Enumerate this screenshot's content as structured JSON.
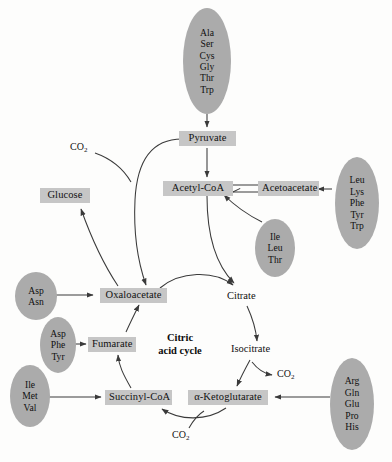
{
  "diagram": {
    "center_caption_line1": "Citric",
    "center_caption_line2": "acid cycle",
    "colors": {
      "box_fill": "#c6c6c6",
      "bubble_fill": "#ababab",
      "edge_stroke": "#3a3a3a",
      "background": "#fdfdfc",
      "text": "#121212"
    }
  },
  "metabolite_boxes": [
    {
      "id": "pyruvate",
      "label": "Pyruvate"
    },
    {
      "id": "acetyl_coa",
      "label": "Acetyl-CoA"
    },
    {
      "id": "acetoacetate",
      "label": "Acetoacetate"
    },
    {
      "id": "glucose",
      "label": "Glucose"
    },
    {
      "id": "oxaloacetate",
      "label": "Oxaloacetate"
    },
    {
      "id": "fumarate",
      "label": "Fumarate"
    },
    {
      "id": "succinyl_coa",
      "label": "Succinyl-CoA"
    },
    {
      "id": "alpha_ketoglutarate",
      "label": "α-Ketoglutarate"
    }
  ],
  "plain_labels": [
    {
      "id": "citrate",
      "label": "Citrate"
    },
    {
      "id": "isocitrate",
      "label": "Isocitrate"
    }
  ],
  "amino_acid_groups": [
    {
      "id": "to_pyruvate",
      "target": "Pyruvate",
      "residues": [
        "Ala",
        "Ser",
        "Cys",
        "Gly",
        "Thr",
        "Trp"
      ]
    },
    {
      "id": "to_acetoacetate",
      "target": "Acetoacetate",
      "residues": [
        "Leu",
        "Lys",
        "Phe",
        "Tyr",
        "Trp"
      ]
    },
    {
      "id": "to_acetyl_coa",
      "target": "Acetyl-CoA",
      "residues": [
        "Ile",
        "Leu",
        "Thr"
      ]
    },
    {
      "id": "to_oxaloacetate",
      "target": "Oxaloacetate",
      "residues": [
        "Asp",
        "Asn"
      ]
    },
    {
      "id": "to_fumarate",
      "target": "Fumarate",
      "residues": [
        "Asp",
        "Phe",
        "Tyr"
      ]
    },
    {
      "id": "to_succinyl_coa",
      "target": "Succinyl-CoA",
      "residues": [
        "Ile",
        "Met",
        "Val"
      ]
    },
    {
      "id": "to_alpha_kg",
      "target": "α-Ketoglutarate",
      "residues": [
        "Arg",
        "Gln",
        "Glu",
        "Pro",
        "His"
      ]
    }
  ],
  "byproduct_labels": [
    {
      "id": "co2_pyruvate_carboxylation",
      "formula": "CO",
      "subscript": "2"
    },
    {
      "id": "co2_isocitrate_dehydrogenase",
      "formula": "CO",
      "subscript": "2"
    },
    {
      "id": "co2_alpha_kg_dehydrogenase",
      "formula": "CO",
      "subscript": "2"
    }
  ],
  "reactions": [
    {
      "id": "aa_to_pyruvate",
      "from": "Ala/Ser/Cys/Gly/Thr/Trp",
      "to": "Pyruvate",
      "type": "single"
    },
    {
      "id": "pyruvate_to_acetyl_coa",
      "from": "Pyruvate",
      "to": "Acetyl-CoA",
      "type": "single"
    },
    {
      "id": "pyruvate_to_oxaloacetate",
      "from": "Pyruvate",
      "to": "Oxaloacetate",
      "type": "single"
    },
    {
      "id": "oxaloacetate_to_glucose",
      "from": "Oxaloacetate",
      "to": "Glucose",
      "type": "single"
    },
    {
      "id": "acetyl_coa_acetoacetate",
      "from": "Acetyl-CoA",
      "to": "Acetoacetate",
      "type": "reversible"
    },
    {
      "id": "aa_to_acetoacetate",
      "from": "Leu/Lys/Phe/Tyr/Trp",
      "to": "Acetoacetate",
      "type": "single"
    },
    {
      "id": "aa_to_acetyl_coa",
      "from": "Ile/Leu/Thr",
      "to": "Acetyl-CoA",
      "type": "single"
    },
    {
      "id": "acetyl_coa_to_citrate",
      "from": "Acetyl-CoA",
      "to": "Citrate",
      "type": "single"
    },
    {
      "id": "oxaloacetate_to_citrate",
      "from": "Oxaloacetate",
      "to": "Citrate",
      "type": "single"
    },
    {
      "id": "citrate_to_isocitrate",
      "from": "Citrate",
      "to": "Isocitrate",
      "type": "single"
    },
    {
      "id": "isocitrate_to_alpha_kg",
      "from": "Isocitrate",
      "to": "α-Ketoglutarate",
      "type": "single"
    },
    {
      "id": "alpha_kg_to_succinyl_coa",
      "from": "α-Ketoglutarate",
      "to": "Succinyl-CoA",
      "type": "single"
    },
    {
      "id": "succinyl_coa_to_fumarate",
      "from": "Succinyl-CoA",
      "to": "Fumarate",
      "type": "single"
    },
    {
      "id": "fumarate_to_oxaloacetate",
      "from": "Fumarate",
      "to": "Oxaloacetate",
      "type": "single"
    },
    {
      "id": "aa_to_oxaloacetate",
      "from": "Asp/Asn",
      "to": "Oxaloacetate",
      "type": "single"
    },
    {
      "id": "aa_to_fumarate",
      "from": "Asp/Phe/Tyr",
      "to": "Fumarate",
      "type": "single"
    },
    {
      "id": "aa_to_succinyl_coa",
      "from": "Ile/Met/Val",
      "to": "Succinyl-CoA",
      "type": "single"
    },
    {
      "id": "aa_to_alpha_kg",
      "from": "Arg/Gln/Glu/Pro/His",
      "to": "α-Ketoglutarate",
      "type": "single"
    }
  ]
}
